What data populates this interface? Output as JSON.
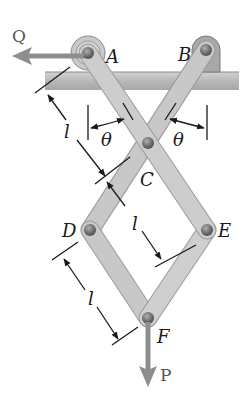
{
  "diagram": {
    "type": "mechanism",
    "points": {
      "A": {
        "label": "A",
        "x": 88,
        "y": 53
      },
      "B": {
        "label": "B",
        "x": 206,
        "y": 50
      },
      "C": {
        "label": "C",
        "x": 148,
        "y": 143
      },
      "D": {
        "label": "D",
        "x": 90,
        "y": 230
      },
      "E": {
        "label": "E",
        "x": 207,
        "y": 230
      },
      "F": {
        "label": "F",
        "x": 148,
        "y": 318
      }
    },
    "forces": {
      "Q": {
        "label": "Q",
        "direction": "left",
        "applied_at": "A"
      },
      "P": {
        "label": "P",
        "direction": "down",
        "applied_at": "F"
      }
    },
    "dimensions": {
      "length_label": "l",
      "angle_label": "θ",
      "length_labels": [
        "l",
        "l",
        "l"
      ],
      "angle_labels": [
        "θ",
        "θ"
      ]
    },
    "members": [
      {
        "from": "A",
        "to": "E"
      },
      {
        "from": "B",
        "to": "D"
      },
      {
        "from": "D",
        "to": "F"
      },
      {
        "from": "E",
        "to": "F"
      }
    ],
    "colors": {
      "bar_fill": "#c4c4c4",
      "bar_edge": "#9a9a9a",
      "ground_fill": "#b5b5b5",
      "pin_fill": "#7a7a7a",
      "force_arrow": "#8e8e8e",
      "dim_line": "#1a1a1a"
    }
  }
}
